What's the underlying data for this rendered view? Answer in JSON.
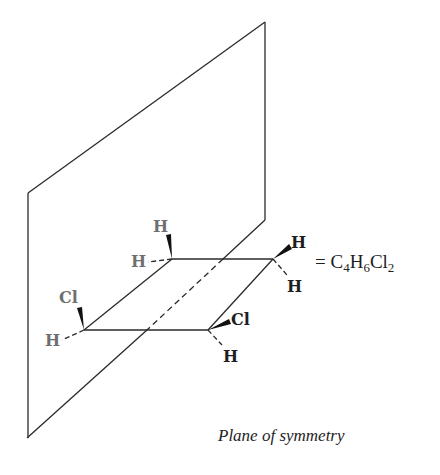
{
  "diagram": {
    "type": "molecular-symmetry-illustration",
    "caption": "Plane of symmetry",
    "formula": {
      "prefix": "= ",
      "parts": [
        {
          "text": "C",
          "sub": "4"
        },
        {
          "text": "H",
          "sub": "6"
        },
        {
          "text": "Cl",
          "sub": "2"
        }
      ]
    },
    "atoms": {
      "c1_top_wedge": "H",
      "c1_dash": "H",
      "c2_wedge": "H",
      "c2_dash": "H",
      "c3_wedge": "Cl",
      "c3_dash": "H",
      "c4_wedge": "Cl",
      "c4_dash": "H"
    },
    "colors": {
      "line": "#2a2a2a",
      "atom_front": "#1e1e1e",
      "atom_behind_plane": "#6f6f6f",
      "background": "#ffffff"
    }
  }
}
